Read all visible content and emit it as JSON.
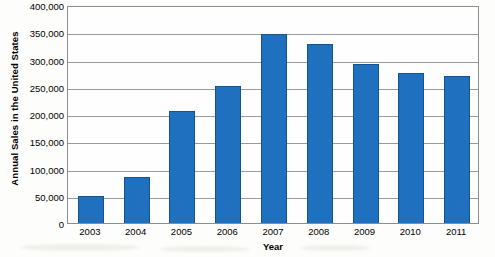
{
  "chart_data": {
    "type": "bar",
    "title": "",
    "xlabel": "Year",
    "ylabel": "Annual Sales in the United States",
    "categories": [
      "2003",
      "2004",
      "2005",
      "2006",
      "2007",
      "2008",
      "2009",
      "2010",
      "2011"
    ],
    "values": [
      50000,
      85000,
      205000,
      252000,
      347000,
      328000,
      291000,
      275000,
      270000
    ],
    "ylim": [
      0,
      400000
    ],
    "yticks": [
      0,
      50000,
      100000,
      150000,
      200000,
      250000,
      300000,
      350000,
      400000
    ],
    "ytick_labels": [
      "0",
      "50,000",
      "100,000",
      "150,000",
      "200,000",
      "250,000",
      "300,000",
      "350,000",
      "400,000"
    ],
    "grid": true,
    "legend": false,
    "series": [
      {
        "name": "Annual Sales",
        "color": "#1f70bf",
        "values": [
          50000,
          85000,
          205000,
          252000,
          347000,
          328000,
          291000,
          275000,
          270000
        ]
      }
    ],
    "colors": {
      "bar_fill": "#1f70bf",
      "bar_border": "#13548f",
      "gridline": "#9a9a9a",
      "axis": "#8d8d8d",
      "plot_background": "#fefefe",
      "page_background": "#fdfdfb",
      "text": "#000000"
    }
  }
}
